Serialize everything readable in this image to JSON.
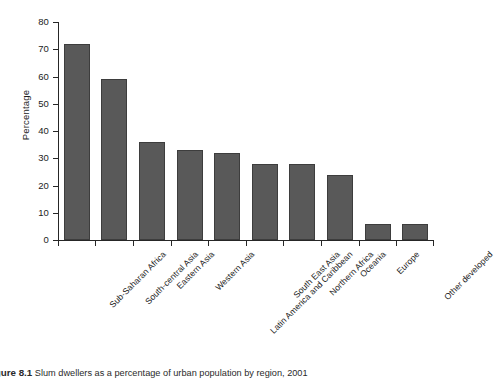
{
  "chart_data": {
    "type": "bar",
    "title": "",
    "xlabel": "",
    "ylabel": "Percentage",
    "ylim": [
      0,
      80
    ],
    "yticks": [
      0,
      10,
      20,
      30,
      40,
      50,
      60,
      70,
      80
    ],
    "grid": false,
    "legend": null,
    "bar_color": "#595959",
    "bar_edge_color": "#3d3d3d",
    "categories": [
      "Sub-Saharan Africa",
      "South-central Asia",
      "Eastern Asia",
      "Western Asia",
      "Latin America and Caribbean",
      "South East Asia",
      "Northern Africa",
      "Oceania",
      "Europe",
      "Other developed"
    ],
    "values": [
      72,
      59,
      36,
      33,
      32,
      28,
      28,
      24,
      6,
      6
    ]
  },
  "axes": {
    "y_title": "Percentage",
    "y_tick_labels": [
      "80",
      "70",
      "60",
      "50",
      "40",
      "30",
      "20",
      "10",
      "0"
    ]
  },
  "caption": {
    "number": "Figure 8.1",
    "text": "Slum dwellers as a percentage of urban population by region, 2001"
  }
}
